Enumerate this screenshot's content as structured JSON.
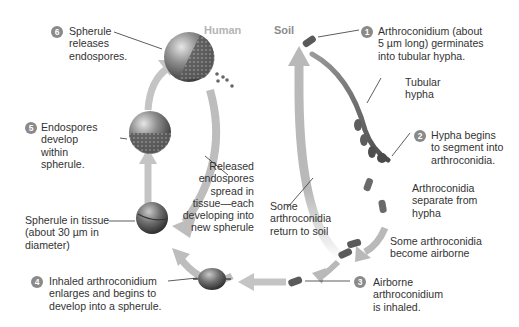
{
  "regions": {
    "human": "Human",
    "soil": "Soil"
  },
  "steps": [
    {
      "number": "1",
      "lines": [
        "Arthroconidium (about",
        "5 µm long) germinates",
        "into tubular hypha."
      ]
    },
    {
      "number": "2",
      "lines": [
        "Hypha begins",
        "to segment into",
        "arthroconidia."
      ]
    },
    {
      "number": "3",
      "lines": [
        "Airborne",
        "arthroconidium",
        "is inhaled."
      ]
    },
    {
      "number": "4",
      "lines": [
        "Inhaled arthroconidium",
        "enlarges and begins to",
        "develop into a spherule."
      ]
    },
    {
      "number": "5",
      "lines": [
        "Endospores",
        "develop",
        "within",
        "spherule."
      ]
    },
    {
      "number": "6",
      "lines": [
        "Spherule",
        "releases",
        "endospores."
      ]
    }
  ],
  "annotations": {
    "tubular_hypha": [
      "Tubular",
      "hypha"
    ],
    "separate": [
      "Arthroconidia",
      "separate from",
      "hypha"
    ],
    "airborne": [
      "Some arthroconidia",
      "become airborne"
    ],
    "return_to_soil": [
      "Some",
      "arthroconidia",
      "return to soil"
    ],
    "released_endospores": [
      "Released",
      "endospores",
      "spread in",
      "tissue—each",
      "developing into",
      "new spherule"
    ],
    "spherule_in_tissue": [
      "Spherule in tissue",
      "(about 30 µm in",
      "diameter)"
    ]
  },
  "colors": {
    "arrow": "#b9b9b9",
    "number_badge": "#8a8a8a",
    "region_label": "#b4b4b4",
    "text": "#333333"
  }
}
